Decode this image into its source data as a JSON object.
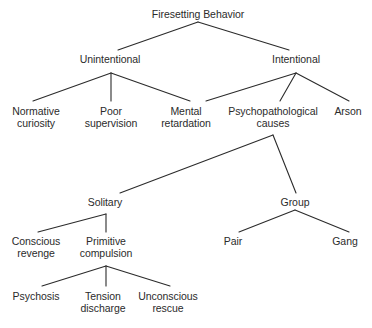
{
  "diagram": {
    "title": "Firesetting Behavior",
    "type": "hierarchical-tree",
    "orientation": "top-down",
    "background_color": "#ffffff",
    "text_color": "#2b2b2b",
    "line_color": "#2b2b2b",
    "nodes": [
      {
        "id": "firesetting_behavior",
        "label": "Firesetting Behavior",
        "x": 198,
        "y": 8,
        "level": 0
      },
      {
        "id": "unintentional",
        "label": "Unintentional",
        "x": 110,
        "y": 53,
        "level": 1
      },
      {
        "id": "intentional",
        "label": "Intentional",
        "x": 296,
        "y": 53,
        "level": 1
      },
      {
        "id": "normative_curiosity",
        "label": "Normative\ncuriosity",
        "x": 36,
        "y": 105,
        "level": 2
      },
      {
        "id": "poor_supervision",
        "label": "Poor\nsupervision",
        "x": 111,
        "y": 105,
        "level": 2
      },
      {
        "id": "mental_retardation",
        "label": "Mental\nretardation",
        "x": 186,
        "y": 105,
        "level": 2
      },
      {
        "id": "psychopathological_causes",
        "label": "Psychopathological\ncauses",
        "x": 273,
        "y": 105,
        "level": 2
      },
      {
        "id": "arson",
        "label": "Arson",
        "x": 348,
        "y": 105,
        "level": 2
      },
      {
        "id": "solitary",
        "label": "Solitary",
        "x": 105,
        "y": 196,
        "level": 3
      },
      {
        "id": "group",
        "label": "Group",
        "x": 295,
        "y": 196,
        "level": 3
      },
      {
        "id": "conscious_revenge",
        "label": "Conscious\nrevenge",
        "x": 36,
        "y": 235,
        "level": 4
      },
      {
        "id": "primitive_compulsion",
        "label": "Primitive\ncompulsion",
        "x": 106,
        "y": 235,
        "level": 4
      },
      {
        "id": "pair",
        "label": "Pair",
        "x": 233,
        "y": 235,
        "level": 4
      },
      {
        "id": "gang",
        "label": "Gang",
        "x": 345,
        "y": 235,
        "level": 4
      },
      {
        "id": "psychosis",
        "label": "Psychosis",
        "x": 36,
        "y": 290,
        "level": 5
      },
      {
        "id": "tension_discharge",
        "label": "Tension\ndischarge",
        "x": 103,
        "y": 290,
        "level": 5
      },
      {
        "id": "unconscious_rescue",
        "label": "Unconscious\nrescue",
        "x": 168,
        "y": 290,
        "level": 5
      }
    ],
    "edges": [
      {
        "from": "firesetting_behavior",
        "to": "unintentional",
        "x1": 198,
        "y1": 22,
        "x2": 118,
        "y2": 50
      },
      {
        "from": "firesetting_behavior",
        "to": "intentional",
        "x1": 198,
        "y1": 22,
        "x2": 289,
        "y2": 50
      },
      {
        "from": "unintentional",
        "to": "normative_curiosity",
        "x1": 111,
        "y1": 73,
        "x2": 33,
        "y2": 101
      },
      {
        "from": "unintentional",
        "to": "poor_supervision",
        "x1": 111,
        "y1": 73,
        "x2": 111,
        "y2": 101
      },
      {
        "from": "unintentional",
        "to": "mental_retardation",
        "x1": 111,
        "y1": 73,
        "x2": 190,
        "y2": 101
      },
      {
        "from": "intentional",
        "to": "mental_retardation",
        "x1": 296,
        "y1": 73,
        "x2": 206,
        "y2": 101
      },
      {
        "from": "intentional",
        "to": "psychopathological_causes",
        "x1": 296,
        "y1": 73,
        "x2": 280,
        "y2": 101
      },
      {
        "from": "intentional",
        "to": "arson",
        "x1": 296,
        "y1": 73,
        "x2": 349,
        "y2": 101
      },
      {
        "from": "psychopathological_causes",
        "to": "solitary",
        "x1": 273,
        "y1": 135,
        "x2": 120,
        "y2": 193
      },
      {
        "from": "psychopathological_causes",
        "to": "group",
        "x1": 273,
        "y1": 135,
        "x2": 296,
        "y2": 193
      },
      {
        "from": "solitary",
        "to": "conscious_revenge",
        "x1": 106,
        "y1": 214,
        "x2": 38,
        "y2": 232
      },
      {
        "from": "solitary",
        "to": "primitive_compulsion",
        "x1": 106,
        "y1": 214,
        "x2": 106,
        "y2": 232
      },
      {
        "from": "group",
        "to": "pair",
        "x1": 295,
        "y1": 210,
        "x2": 239,
        "y2": 232
      },
      {
        "from": "group",
        "to": "gang",
        "x1": 295,
        "y1": 210,
        "x2": 349,
        "y2": 232
      },
      {
        "from": "primitive_compulsion",
        "to": "psychosis",
        "x1": 106,
        "y1": 266,
        "x2": 42,
        "y2": 286
      },
      {
        "from": "primitive_compulsion",
        "to": "tension_discharge",
        "x1": 106,
        "y1": 266,
        "x2": 106,
        "y2": 286
      },
      {
        "from": "primitive_compulsion",
        "to": "unconscious_rescue",
        "x1": 106,
        "y1": 266,
        "x2": 170,
        "y2": 286
      }
    ]
  }
}
